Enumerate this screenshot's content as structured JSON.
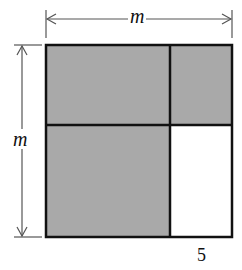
{
  "diagram": {
    "labels": {
      "top_dimension": "m",
      "left_dimension": "m",
      "bottom_right_width": "5"
    },
    "colors": {
      "shaded": "#a9a9a9",
      "unshaded": "#ffffff",
      "outline": "#111111",
      "dimension_line": "#555555"
    },
    "regions": [
      {
        "name": "top-left",
        "shaded": true
      },
      {
        "name": "top-right",
        "shaded": true
      },
      {
        "name": "bottom-left",
        "shaded": true
      },
      {
        "name": "bottom-right",
        "shaded": false
      }
    ]
  }
}
